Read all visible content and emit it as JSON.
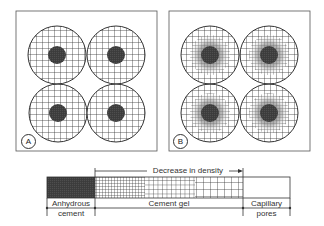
{
  "panels": [
    {
      "id": "A",
      "label": "A",
      "description": "Four cement grains with uniform gel coating and dark anhydrous cores"
    },
    {
      "id": "B",
      "label": "B",
      "description": "Four cement grains with density gradient gel around anhydrous cores"
    }
  ],
  "density_bar": {
    "arrow_label": "Decrease in density",
    "segments": [
      {
        "name": "anhydrous-cement",
        "label": "Anhydrous cement",
        "line1": "Anhydrous",
        "line2": "cement"
      },
      {
        "name": "cement-gel",
        "label": "Cement gel"
      },
      {
        "name": "capillary-pores",
        "label": "Capillary pores",
        "line1": "Capillary",
        "line2": "pores"
      }
    ]
  },
  "colors": {
    "line": "#333333",
    "core": "#3a3a3a",
    "gradient_inner": "#6e6e6e",
    "background": "#ffffff"
  }
}
